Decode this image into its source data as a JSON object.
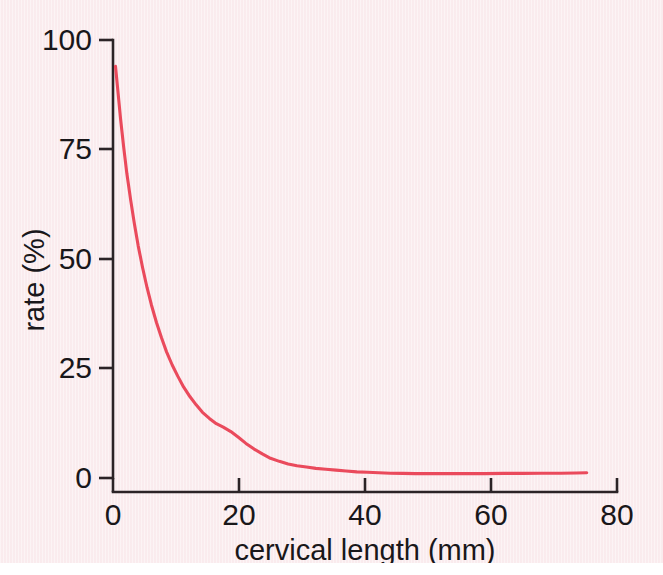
{
  "figure": {
    "background_color": "#fbeff1",
    "curve_color": "#ea4a5c",
    "axis_color": "#2b2326"
  },
  "chart_data": {
    "type": "line",
    "title": "",
    "subtitle": "",
    "xlabel": "cervical length  (mm)",
    "ylabel": "rate  (%)",
    "xlim": [
      0,
      80
    ],
    "ylim": [
      0,
      100
    ],
    "xticks": [
      0,
      20,
      40,
      60,
      80
    ],
    "xticklabels": [
      "0",
      "20",
      "40",
      "60",
      "80"
    ],
    "yticks": [
      0,
      25,
      50,
      75,
      100
    ],
    "yticklabels": [
      "0",
      "25",
      "50",
      "75",
      "100"
    ],
    "grid": false,
    "legend": null,
    "annotations": [],
    "series": [
      {
        "name": "rate",
        "color": "#ea4a5c",
        "x": [
          0.4,
          0.8,
          1.2,
          1.7,
          2.2,
          2.8,
          3.4,
          4.0,
          4.7,
          5.4,
          6.1,
          6.9,
          7.7,
          8.5,
          9.4,
          10.3,
          11.2,
          12.2,
          13.2,
          14.2,
          15.3,
          16.4,
          17.5,
          18.7,
          19.9,
          21.1,
          22.4,
          23.7,
          25.0,
          26.4,
          27.8,
          29.2,
          30.7,
          32.2,
          33.8,
          35.4,
          37.0,
          38.7,
          40.4,
          42.2,
          44.0,
          46.0,
          48.0,
          50.5,
          53.0,
          56.0,
          59.0,
          62.0,
          65.0,
          68.0,
          71.0,
          73.5,
          75.2
        ],
        "y": [
          94.0,
          88.0,
          82.0,
          75.5,
          69.5,
          63.5,
          58.0,
          53.0,
          48.0,
          43.5,
          39.5,
          35.5,
          32.0,
          28.8,
          25.8,
          23.2,
          20.8,
          18.6,
          16.7,
          15.0,
          13.6,
          12.4,
          11.6,
          10.6,
          9.3,
          7.9,
          6.6,
          5.5,
          4.5,
          3.8,
          3.2,
          2.8,
          2.5,
          2.2,
          2.0,
          1.8,
          1.6,
          1.4,
          1.3,
          1.2,
          1.1,
          1.05,
          1.0,
          1.0,
          1.0,
          1.0,
          1.0,
          1.05,
          1.05,
          1.1,
          1.1,
          1.15,
          1.2
        ]
      }
    ]
  }
}
